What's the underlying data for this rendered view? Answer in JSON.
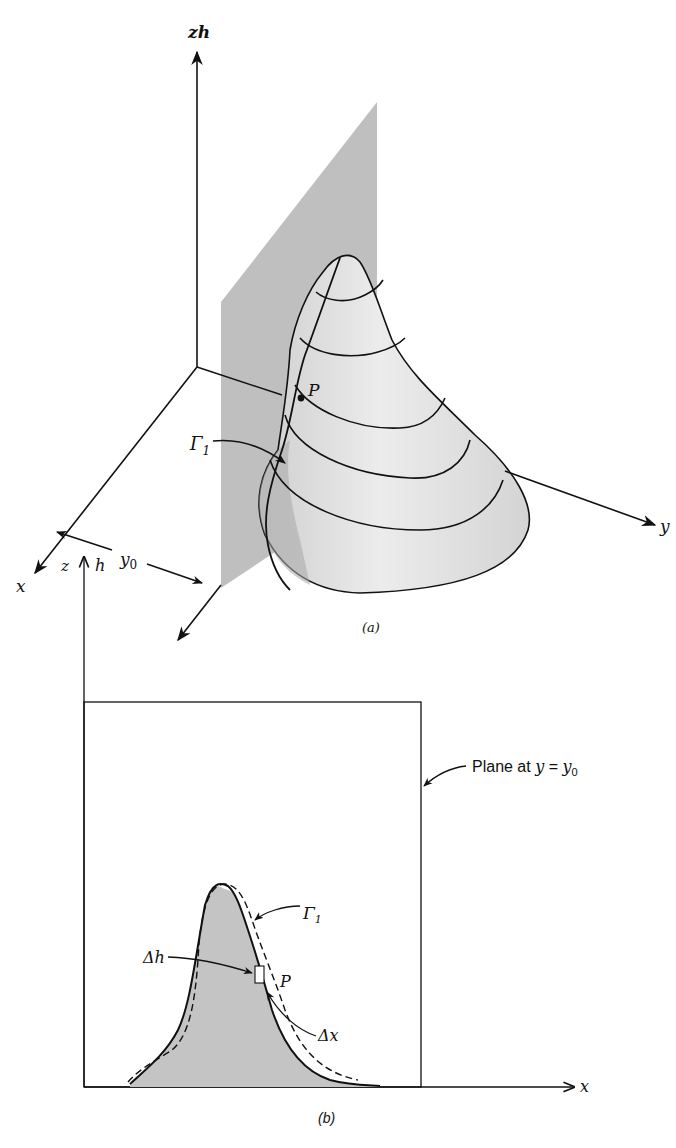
{
  "figure": {
    "panel_a": {
      "caption": "(a)",
      "axes": {
        "vertical": "zh",
        "x": "x",
        "y": "y"
      },
      "labels": {
        "point": "P",
        "curve": "Γ",
        "curve_sub": "1",
        "offset": "y",
        "offset_sub": "0"
      }
    },
    "panel_b": {
      "caption": "(b)",
      "axes": {
        "z": "z",
        "h": "h",
        "x": "x"
      },
      "labels": {
        "plane": "Plane at ",
        "plane_eq_y": "y",
        "plane_eq": " = ",
        "plane_eq_y0": "y",
        "plane_eq_sub": "0",
        "curve": "Γ",
        "curve_sub": "1",
        "delta_h": "Δh",
        "delta_x": "Δx",
        "point": "P"
      }
    },
    "colors": {
      "ink": "#111111",
      "plane_fill": "#b8b8b8",
      "surface_fill": "#dcdcdc",
      "profile_fill": "#c4c4c4"
    }
  }
}
